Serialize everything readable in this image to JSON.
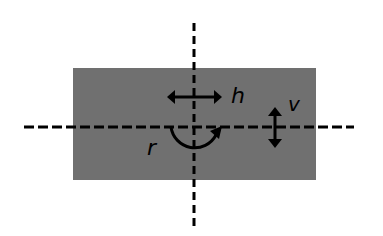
{
  "diagram": {
    "colors": {
      "background": "#ffffff",
      "rectangle": "#707070",
      "stroke": "#000000"
    },
    "rectangle": {
      "x": 73,
      "y": 68,
      "width": 243,
      "height": 112
    },
    "axes": {
      "vertical": {
        "x": 194,
        "y1": 23,
        "y2": 228
      },
      "horizontal": {
        "y": 127,
        "x1": 24,
        "x2": 354
      }
    },
    "labels": {
      "horizontal_motion": "h",
      "vertical_motion": "v",
      "rotation": "r"
    }
  }
}
